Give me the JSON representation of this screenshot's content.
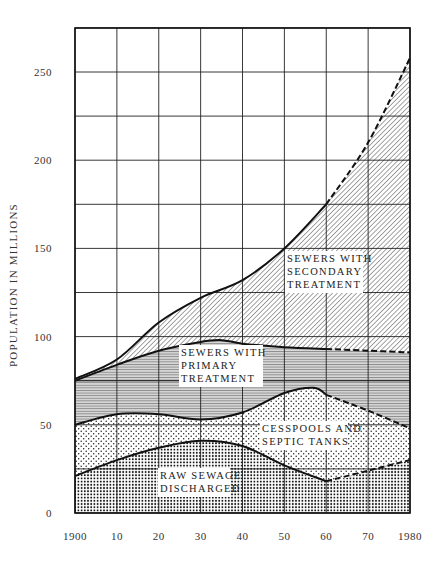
{
  "chart_data": {
    "type": "area",
    "stacked": true,
    "title": "",
    "xlabel": "",
    "ylabel": "POPULATION IN MILLIONS",
    "xlim": [
      1900,
      1980
    ],
    "ylim": [
      0,
      275
    ],
    "grid": true,
    "x_ticks": [
      1900,
      1910,
      1920,
      1930,
      1940,
      1950,
      1960,
      1970,
      1980
    ],
    "x_tick_labels": [
      "1900",
      "10",
      "20",
      "30",
      "40",
      "50",
      "60",
      "70",
      "1980"
    ],
    "y_ticks": [
      0,
      50,
      100,
      150,
      200,
      250
    ],
    "y_tick_labels": [
      "0",
      "50",
      "100",
      "150",
      "200",
      "250"
    ],
    "projected_from": 1960,
    "series": [
      {
        "name": "Raw sewage discharged",
        "label_lines": [
          "RAW SEWAGE",
          "DISCHARGED"
        ],
        "pattern": "dense-dots",
        "x": [
          1900,
          1910,
          1920,
          1930,
          1940,
          1950,
          1960,
          1970,
          1980
        ],
        "cumulative_top": [
          21,
          30,
          37,
          41,
          38,
          27,
          18,
          24,
          30
        ]
      },
      {
        "name": "Cesspools and septic tanks",
        "label_lines": [
          "CESSPOOLS AND",
          "SEPTIC TANKS"
        ],
        "pattern": "sparse-dots",
        "x": [
          1900,
          1910,
          1920,
          1930,
          1940,
          1950,
          1957,
          1960,
          1970,
          1980
        ],
        "cumulative_top": [
          50,
          56,
          56,
          53,
          57,
          68,
          71,
          67,
          58,
          48
        ]
      },
      {
        "name": "Sewers with primary treatment",
        "label_lines": [
          "SEWERS WITH",
          "PRIMARY",
          "TREATMENT"
        ],
        "pattern": "horizontal-lines",
        "x": [
          1900,
          1910,
          1920,
          1930,
          1935,
          1940,
          1950,
          1960,
          1970,
          1980
        ],
        "cumulative_top": [
          75,
          84,
          92,
          97,
          98,
          96,
          94,
          93,
          92,
          91
        ]
      },
      {
        "name": "Sewers with secondary treatment",
        "label_lines": [
          "SEWERS WITH",
          "SECONDARY",
          "TREATMENT"
        ],
        "pattern": "diagonal-hatch",
        "x": [
          1900,
          1910,
          1920,
          1930,
          1940,
          1950,
          1960,
          1970,
          1980
        ],
        "cumulative_top": [
          76,
          87,
          108,
          122,
          132,
          150,
          175,
          210,
          258
        ]
      }
    ]
  }
}
